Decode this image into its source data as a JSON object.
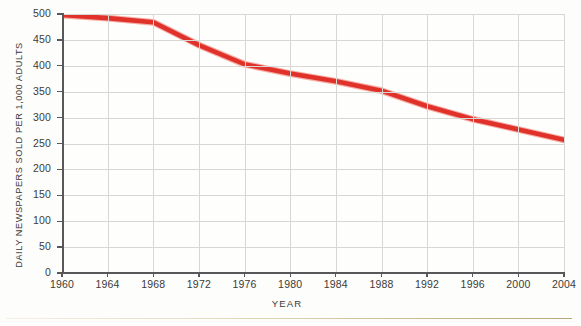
{
  "chart_data": {
    "type": "line",
    "title": "",
    "xlabel": "YEAR",
    "ylabel": "DAILY NEWSPAPERS SOLD PER 1,000 ADULTS",
    "xlim": [
      1960,
      2004
    ],
    "ylim": [
      0,
      500
    ],
    "grid": true,
    "legend": "none",
    "line_color": "#e0322a",
    "x": [
      1960,
      1964,
      1968,
      1972,
      1976,
      1980,
      1984,
      1988,
      1992,
      1996,
      2000,
      2004
    ],
    "values": [
      498,
      492,
      484,
      440,
      403,
      385,
      370,
      352,
      322,
      297,
      277,
      257
    ],
    "series": [
      {
        "name": "Daily newspapers sold per 1,000 adults",
        "values": [
          498,
          492,
          484,
          440,
          403,
          385,
          370,
          352,
          322,
          297,
          277,
          257
        ]
      }
    ],
    "categories": [
      "1960",
      "1964",
      "1968",
      "1972",
      "1976",
      "1980",
      "1984",
      "1988",
      "1992",
      "1996",
      "2000",
      "2004"
    ],
    "y_ticks": [
      0,
      50,
      100,
      150,
      200,
      250,
      300,
      350,
      400,
      450,
      500
    ],
    "y_tick_labels": [
      "0",
      "50",
      "100",
      "150",
      "200",
      "250",
      "300",
      "350",
      "400",
      "450",
      "500"
    ],
    "x_ticks": [
      1960,
      1964,
      1968,
      1972,
      1976,
      1980,
      1984,
      1988,
      1992,
      1996,
      2000,
      2004
    ],
    "x_tick_labels": [
      "1960",
      "1964",
      "1968",
      "1972",
      "1976",
      "1980",
      "1984",
      "1988",
      "1992",
      "1996",
      "2000",
      "2004"
    ]
  },
  "axes": {
    "y_title": "DAILY NEWSPAPERS SOLD PER 1,000 ADULTS",
    "x_title": "YEAR"
  }
}
